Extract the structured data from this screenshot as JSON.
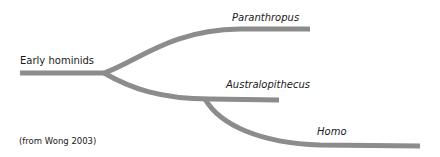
{
  "diagram": {
    "type": "phylogenetic-tree",
    "root": {
      "label": "Early hominids"
    },
    "branches": [
      {
        "label": "Paranthropus",
        "parent": "Early hominids"
      },
      {
        "label": "Australopithecus",
        "parent": "Early hominids"
      },
      {
        "label": "Homo",
        "parent": "Australopithecus"
      }
    ],
    "caption": "(from Wong 2003)",
    "colors": {
      "branch": "#8c8c8c",
      "text": "#1a1a1a",
      "background": "#ffffff"
    }
  }
}
